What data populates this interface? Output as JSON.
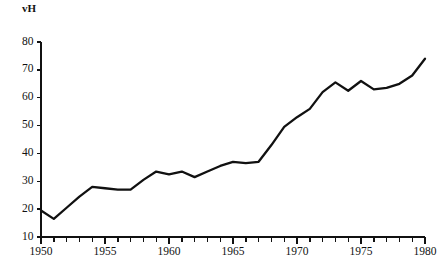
{
  "chart_data": {
    "type": "line",
    "title": "",
    "subtitle": "",
    "xlabel": "",
    "ylabel": "vH",
    "xlim": [
      1950,
      1980
    ],
    "ylim": [
      10,
      80
    ],
    "grid": false,
    "legend": false,
    "legend_position": "none",
    "line_color": "#111111",
    "background_color": "#ffffff",
    "x_tick_labels": [
      "1950",
      "1955",
      "1960",
      "1965",
      "1970",
      "1975",
      "1980"
    ],
    "x_tick_values": [
      1950,
      1955,
      1960,
      1965,
      1970,
      1975,
      1980
    ],
    "x_minor_tick_interval": 1,
    "y_tick_labels": [
      "10",
      "20",
      "30",
      "40",
      "50",
      "60",
      "70",
      "80"
    ],
    "y_tick_values": [
      10,
      20,
      30,
      40,
      50,
      60,
      70,
      80
    ],
    "x": [
      1950,
      1951,
      1952,
      1953,
      1954,
      1955,
      1956,
      1957,
      1958,
      1959,
      1960,
      1961,
      1962,
      1963,
      1964,
      1965,
      1966,
      1967,
      1968,
      1969,
      1970,
      1971,
      1972,
      1973,
      1974,
      1975,
      1976,
      1977,
      1978,
      1979,
      1980
    ],
    "values": [
      19.5,
      16.5,
      20.5,
      24.5,
      28.0,
      27.5,
      27.0,
      27.0,
      30.5,
      33.5,
      32.5,
      33.5,
      31.5,
      33.5,
      35.5,
      37.0,
      36.5,
      37.0,
      43.0,
      49.5,
      53.0,
      56.0,
      62.0,
      65.5,
      62.5,
      66.0,
      63.0,
      63.5,
      65.0,
      68.0,
      74.0
    ],
    "series": [
      {
        "name": "vH",
        "values": [
          19.5,
          16.5,
          20.5,
          24.5,
          28.0,
          27.5,
          27.0,
          27.0,
          30.5,
          33.5,
          32.5,
          33.5,
          31.5,
          33.5,
          35.5,
          37.0,
          36.5,
          37.0,
          43.0,
          49.5,
          53.0,
          56.0,
          62.0,
          65.5,
          62.5,
          66.0,
          63.0,
          63.5,
          65.0,
          68.0,
          74.0
        ]
      }
    ]
  }
}
